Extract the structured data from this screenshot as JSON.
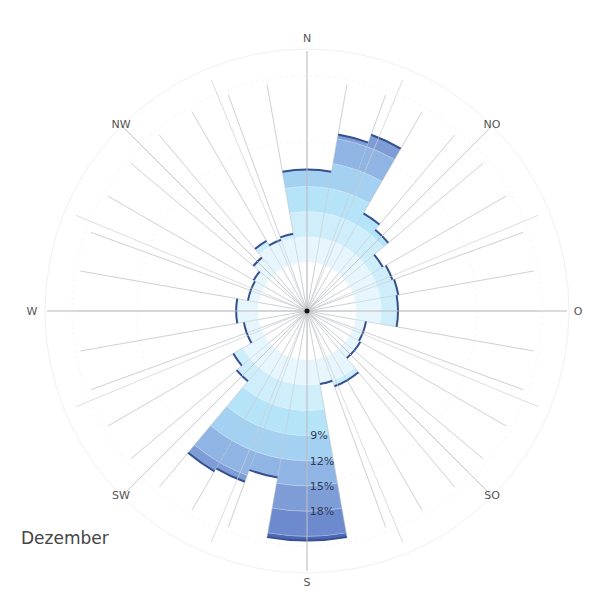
{
  "chart_data": {
    "type": "wind-rose",
    "title": "Dezember",
    "sector_width_deg": 10,
    "sectors_start_deg": [
      0,
      10,
      20,
      30,
      40,
      50,
      60,
      70,
      80,
      90,
      100,
      110,
      120,
      130,
      140,
      150,
      160,
      170,
      180,
      190,
      200,
      210,
      220,
      230,
      240,
      250,
      260,
      270,
      280,
      290,
      300,
      310,
      320,
      330,
      340,
      350
    ],
    "values_percent": [
      11,
      15.5,
      16.5,
      7.6,
      6.8,
      4.6,
      5,
      5.2,
      5,
      5,
      1.3,
      1.3,
      1.5,
      1.5,
      3.7,
      3.7,
      3,
      21.5,
      21.5,
      14.3,
      15.8,
      16.2,
      5.1,
      4.3,
      1.8,
      1.8,
      2.6,
      2.6,
      1.3,
      1.3,
      1.5,
      2.5,
      3.8,
      3.2,
      3.5,
      11
    ],
    "band_step_percent": 3,
    "band_colors": [
      "#e6f6fc",
      "#cdeefa",
      "#b5e3f7",
      "#a4d0f1",
      "#90b4e3",
      "#7e9dd7",
      "#6c8acd",
      "#4a68b3"
    ],
    "ring_labels": [
      "9%",
      "12%",
      "15%",
      "18%"
    ],
    "directions": [
      "N",
      "NO",
      "O",
      "SO",
      "S",
      "SW",
      "W",
      "NW"
    ],
    "calm_radius_px": 49,
    "px_per_percent": 8.4,
    "outer_radius_px": 260
  },
  "labels": {
    "month": "Dezember",
    "N": "N",
    "NO": "NO",
    "O": "O",
    "SO": "SO",
    "S": "S",
    "SW": "SW",
    "W": "W",
    "NW": "NW",
    "r9": "9%",
    "r12": "12%",
    "r15": "15%",
    "r18": "18%"
  }
}
